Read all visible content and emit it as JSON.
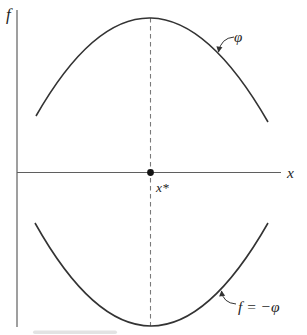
{
  "figure": {
    "labels": {
      "y_axis": "f",
      "x_axis": "x",
      "critical_point": "x*",
      "top_curve": "φ",
      "bottom_curve": "f = −φ"
    },
    "colors": {
      "background": "#ffffff",
      "curve": "#333333",
      "axis": "#5f5f5f",
      "dashed": "#7a7a7a",
      "dot": "#141414",
      "arrow": "#333333",
      "artifact": "#cccccc"
    }
  }
}
